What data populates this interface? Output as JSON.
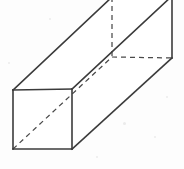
{
  "figure": {
    "shape_name": "rectangular-prism",
    "projection": "oblique",
    "background_color": "#fdfdfd",
    "visible_edge_color": "#3b3b3b",
    "hidden_edge_color": "#4a4a4a",
    "face_fill_color": "#ffffff",
    "visible_edge_width": 1.6,
    "hidden_edge_width": 1.25,
    "hidden_dash_pattern": "5 4",
    "canvas": {
      "width": 184,
      "height": 169
    }
  },
  "geometry": {
    "vertices": {
      "front_top_left": {
        "x": 13,
        "y": 90
      },
      "front_top_right": {
        "x": 72,
        "y": 89
      },
      "front_bottom_left": {
        "x": 13,
        "y": 149
      },
      "front_bottom_right": {
        "x": 72,
        "y": 149
      },
      "back_top_left": {
        "x": 112,
        "y": -3
      },
      "back_top_right": {
        "x": 172,
        "y": -4
      },
      "back_bottom_left": {
        "x": 112,
        "y": 57
      },
      "back_bottom_right": {
        "x": 172,
        "y": 58
      }
    },
    "visible_edges": [
      {
        "name": "front-face-top",
        "from": "front_top_left",
        "to": "front_top_right"
      },
      {
        "name": "front-face-left",
        "from": "front_top_left",
        "to": "front_bottom_left"
      },
      {
        "name": "front-face-right",
        "from": "front_top_right",
        "to": "front_bottom_right"
      },
      {
        "name": "front-face-bottom",
        "from": "front_bottom_left",
        "to": "front_bottom_right"
      },
      {
        "name": "top-left-receding",
        "from": "front_top_left",
        "to": "back_top_left"
      },
      {
        "name": "top-right-receding",
        "from": "front_top_right",
        "to": "back_top_right"
      },
      {
        "name": "bottom-right-receding",
        "from": "front_bottom_right",
        "to": "back_bottom_right"
      },
      {
        "name": "back-face-right",
        "from": "back_top_right",
        "to": "back_bottom_right"
      }
    ],
    "hidden_edges": [
      {
        "name": "back-face-left-vertical",
        "from": "back_top_left",
        "to": "back_bottom_left"
      },
      {
        "name": "back-face-bottom",
        "from": "back_bottom_left",
        "to": "back_bottom_right"
      },
      {
        "name": "bottom-left-receding",
        "from": "front_bottom_left",
        "to": "back_bottom_left"
      }
    ],
    "space_diagonal": {
      "name": "space-diagonal",
      "from": "front_bottom_left",
      "to": "back_bottom_left",
      "style": "dashed"
    }
  },
  "specks": [
    {
      "x": 123,
      "y": 122,
      "size": 3
    },
    {
      "x": 154,
      "y": 136,
      "size": 2
    },
    {
      "x": 49,
      "y": 18,
      "size": 2
    },
    {
      "x": 8,
      "y": 62,
      "size": 2
    },
    {
      "x": 166,
      "y": 96,
      "size": 2
    },
    {
      "x": 96,
      "y": 156,
      "size": 2
    }
  ]
}
